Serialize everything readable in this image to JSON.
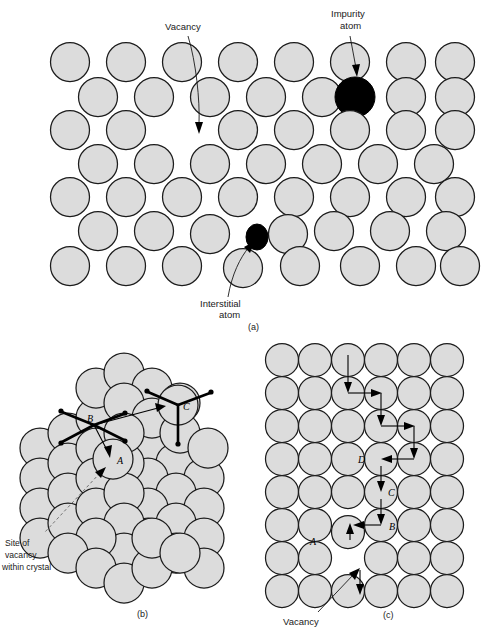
{
  "figure": {
    "background_color": "#ffffff",
    "atom_fill_color": "#dcdcdc",
    "atom_stroke_color": "#1c1c1c",
    "defect_fill_color": "#000000"
  },
  "panel_a": {
    "caption": "(a)",
    "labels": {
      "vacancy": "Vacancy",
      "impurity_line1": "Impurity",
      "impurity_line2": "atom",
      "interstitial_line1": "Interstitial",
      "interstitial_line2": "atom"
    },
    "description": "Close-packed two dimensional plane of atoms containing a vacancy, a substitutional impurity atom, and an interstitial atom",
    "atom_radius": 19.5,
    "rows": [
      {
        "y": 62,
        "x": [
          70,
          126,
          182,
          238,
          294,
          350,
          406,
          455
        ]
      },
      {
        "y": 97,
        "x": [
          98,
          154,
          210,
          266,
          322,
          378,
          434
        ]
      },
      {
        "y": 130,
        "x": [
          70,
          126,
          238,
          294,
          350,
          406,
          455
        ]
      },
      {
        "y": 164,
        "x": [
          98,
          154,
          210,
          266,
          322,
          378,
          434
        ]
      },
      {
        "y": 197,
        "x": [
          70,
          126,
          182,
          238,
          294,
          350,
          406,
          455
        ]
      },
      {
        "y": 231,
        "x": [
          98,
          154,
          210,
          284,
          322,
          378,
          434
        ]
      },
      {
        "y": 265,
        "x": [
          70,
          126,
          182,
          238,
          294,
          350,
          406,
          455
        ]
      }
    ],
    "impurity_atom": {
      "x": 355,
      "y": 97,
      "r": 20
    },
    "interstitial_atom": {
      "x": 257,
      "y": 237,
      "rx": 11,
      "ry": 13
    },
    "vacancy_gap": {
      "x": 182,
      "y": 130
    }
  },
  "panel_b": {
    "caption": "(b)",
    "labels": {
      "site_line1": "Site of",
      "site_line2": "vacancy",
      "site_line3": "within crystal",
      "site_a": "A",
      "site_b": "B",
      "site_c": "C"
    },
    "description": "Three dimensional representation of a vacancy site within a crystal with vectors indicating possible atomic jump directions",
    "vacancy_sites": [
      {
        "id": "A",
        "label": "A",
        "x": 113,
        "y": 129
      },
      {
        "id": "B",
        "label": "B",
        "x": 94,
        "y": 95
      },
      {
        "id": "C",
        "label": "C",
        "x": 178,
        "y": 75
      }
    ]
  },
  "panel_c": {
    "caption": "(c)",
    "labels": {
      "vacancy": "Vacancy",
      "site_a": "A",
      "site_b": "B",
      "site_c": "C",
      "site_d": "D"
    },
    "description": "Two dimensional square lattice showing the sequence of atomic jumps A, B, C, D by which a vacancy migrates through the crystal",
    "grid": {
      "columns": 6,
      "rows": 8,
      "spacing": 33,
      "atom_radius": 16.5,
      "origin_x": 32,
      "origin_y": 30
    },
    "vacancy_cell": {
      "column": 4,
      "row": 7
    },
    "jump_sites": [
      {
        "id": "A",
        "label": "A",
        "x": 64,
        "y": 211
      },
      {
        "id": "B",
        "label": "B",
        "x": 124,
        "y": 207
      },
      {
        "id": "C",
        "label": "C",
        "x": 122,
        "y": 155
      },
      {
        "id": "D",
        "label": "D",
        "x": 92,
        "y": 120
      }
    ]
  }
}
